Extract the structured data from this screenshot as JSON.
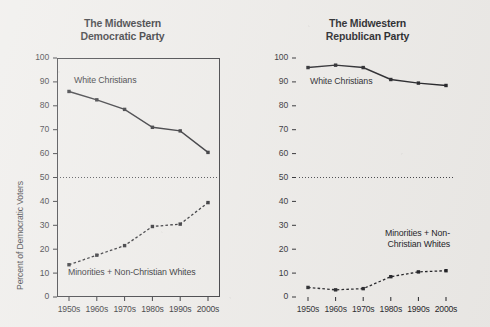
{
  "figure": {
    "background_color": "#eceae7",
    "ink_color": "#1b1b1f"
  },
  "chart_data": [
    {
      "type": "line",
      "title": "The Midwestern Democratic Party",
      "title_line1": "The Midwestern",
      "title_line2": "Democratic Party",
      "xlabel": "",
      "ylabel": "Percent of Democratic Voters",
      "ylim": [
        0,
        100
      ],
      "ytick_step": 10,
      "yticks": [
        "0",
        "10",
        "20",
        "30",
        "40",
        "50",
        "60",
        "70",
        "80",
        "90",
        "100"
      ],
      "categories": [
        "1950s",
        "1960s",
        "1970s",
        "1980s",
        "1990s",
        "2000s"
      ],
      "grid": false,
      "legend_position": "inline-annotation",
      "reference_line": {
        "value": 50,
        "style": "dotted",
        "label": ""
      },
      "series": [
        {
          "name": "White Christians",
          "values": [
            86,
            82.5,
            78.5,
            71,
            69.5,
            60.5
          ],
          "line_style": "solid",
          "marker": "square",
          "color": "#1b1b1f",
          "annotation": "White Christians"
        },
        {
          "name": "Minorities + Non-Christian Whites",
          "values": [
            13.5,
            17.5,
            21.5,
            29.5,
            30.5,
            39.5
          ],
          "line_style": "dashed",
          "marker": "square",
          "color": "#1b1b1f",
          "annotation": "Minorities + Non-Christian Whites"
        }
      ]
    },
    {
      "type": "line",
      "title": "The Midwestern Republican Party",
      "title_line1": "The Midwestern",
      "title_line2": "Republican Party",
      "xlabel": "",
      "ylabel": "Percent of Republican Voters",
      "ylim": [
        0,
        100
      ],
      "ytick_step": 10,
      "yticks": [
        "0",
        "10",
        "20",
        "30",
        "40",
        "50",
        "60",
        "70",
        "80",
        "90",
        "100"
      ],
      "categories": [
        "1950s",
        "1960s",
        "1970s",
        "1980s",
        "1990s",
        "2000s"
      ],
      "grid": false,
      "legend_position": "inline-annotation",
      "reference_line": {
        "value": 50,
        "style": "dotted",
        "label": ""
      },
      "series": [
        {
          "name": "White Christians",
          "values": [
            96,
            97,
            96,
            91,
            89.5,
            88.5
          ],
          "line_style": "solid",
          "marker": "square",
          "color": "#1b1b1f",
          "annotation": "White Christians"
        },
        {
          "name": "Minorities + Non-Christian Whites",
          "values": [
            4,
            3,
            3.5,
            8.5,
            10.5,
            11
          ],
          "line_style": "dashed",
          "marker": "square",
          "color": "#1b1b1f",
          "annotation_line1": "Minorities + Non-",
          "annotation_line2": "Christian Whites",
          "annotation": "Minorities + Non-Christian Whites"
        }
      ]
    }
  ]
}
